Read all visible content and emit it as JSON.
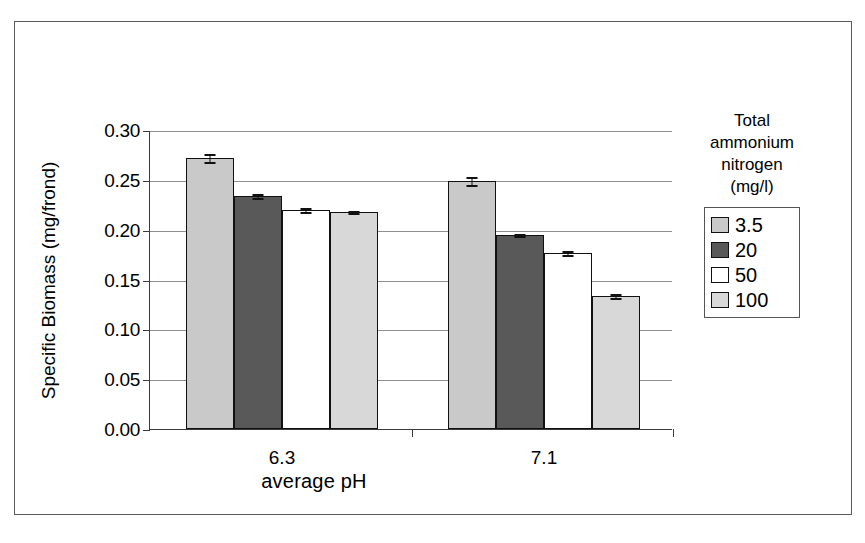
{
  "chart_data": {
    "type": "bar",
    "title": "",
    "xlabel": "average  pH",
    "ylabel": "Specific Biomass (mg/frond)",
    "categories": [
      "6.3",
      "7.1"
    ],
    "ylim": [
      0.0,
      0.3
    ],
    "yticks": [
      "0.00",
      "0.05",
      "0.10",
      "0.15",
      "0.20",
      "0.25",
      "0.30"
    ],
    "grid": true,
    "legend_position": "right",
    "legend_title": "Total ammonium nitrogen (mg/l)",
    "legend_title_lines": [
      "Total",
      "ammonium",
      "nitrogen",
      "(mg/l)"
    ],
    "series": [
      {
        "name": "3.5",
        "color": "#c9c9c9",
        "values": [
          0.272,
          0.249
        ],
        "errors": [
          0.005,
          0.005
        ]
      },
      {
        "name": "20",
        "color": "#595959",
        "values": [
          0.234,
          0.195
        ],
        "errors": [
          0.003,
          0.002
        ]
      },
      {
        "name": "50",
        "color": "#ffffff",
        "values": [
          0.22,
          0.177
        ],
        "errors": [
          0.003,
          0.003
        ]
      },
      {
        "name": "100",
        "color": "#d8d8d8",
        "values": [
          0.218,
          0.133
        ],
        "errors": [
          0.002,
          0.003
        ]
      }
    ]
  },
  "axis": {
    "y_title": "Specific Biomass (mg/frond)",
    "x_title": "average  pH",
    "tick_0": "0.00",
    "tick_1": "0.05",
    "tick_2": "0.10",
    "tick_3": "0.15",
    "tick_4": "0.20",
    "tick_5": "0.25",
    "tick_6": "0.30",
    "cat_0": "6.3",
    "cat_1": "7.1"
  },
  "legend": {
    "title_line_1": "Total",
    "title_line_2": "ammonium",
    "title_line_3": "nitrogen",
    "title_line_4": "(mg/l)",
    "items": [
      {
        "label": "3.5"
      },
      {
        "label": "20"
      },
      {
        "label": "50"
      },
      {
        "label": "100"
      }
    ]
  }
}
